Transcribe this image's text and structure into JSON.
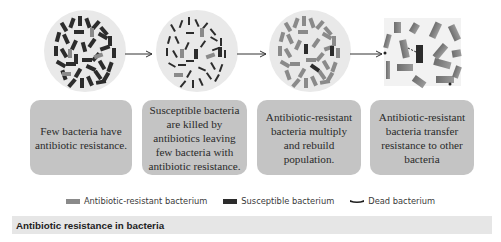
{
  "diagram": {
    "stages": [
      {
        "id": 1,
        "description": "Few bacteria have antibiotic resistance.",
        "illustration": "dense-mixed-population"
      },
      {
        "id": 2,
        "description": "Susceptible bacteria are killed by antibiotics leaving few bacteria with antibiotic resistance.",
        "illustration": "dead-susceptible-population"
      },
      {
        "id": 3,
        "description": "Antibiotic-resistant bacteria multiply and rebuild population.",
        "illustration": "resistant-population"
      },
      {
        "id": 4,
        "description": "Antibiotic-resistant bacteria transfer resistance to other bacteria",
        "illustration": "resistance-transfer-closeup"
      }
    ],
    "arrows": [
      "stage1-to-stage2",
      "stage2-to-stage3",
      "stage3-to-stage4"
    ]
  },
  "legend": {
    "items": [
      {
        "label": "Antibiotic-resistant bacterium",
        "color": "#8a8a8a"
      },
      {
        "label": "Susceptible bacterium",
        "color": "#2c2c2c"
      },
      {
        "label": "Dead bacterium",
        "color": "#1e1e1e"
      }
    ]
  },
  "caption": {
    "text": "Antibiotic resistance in bacteria"
  },
  "colors": {
    "circle_bg": "#e9e9e9",
    "box_bg": "#c4c4c4",
    "caption_bg": "#e6e6e6",
    "resistant": "#8a8a8a",
    "susceptible": "#2c2c2c"
  }
}
